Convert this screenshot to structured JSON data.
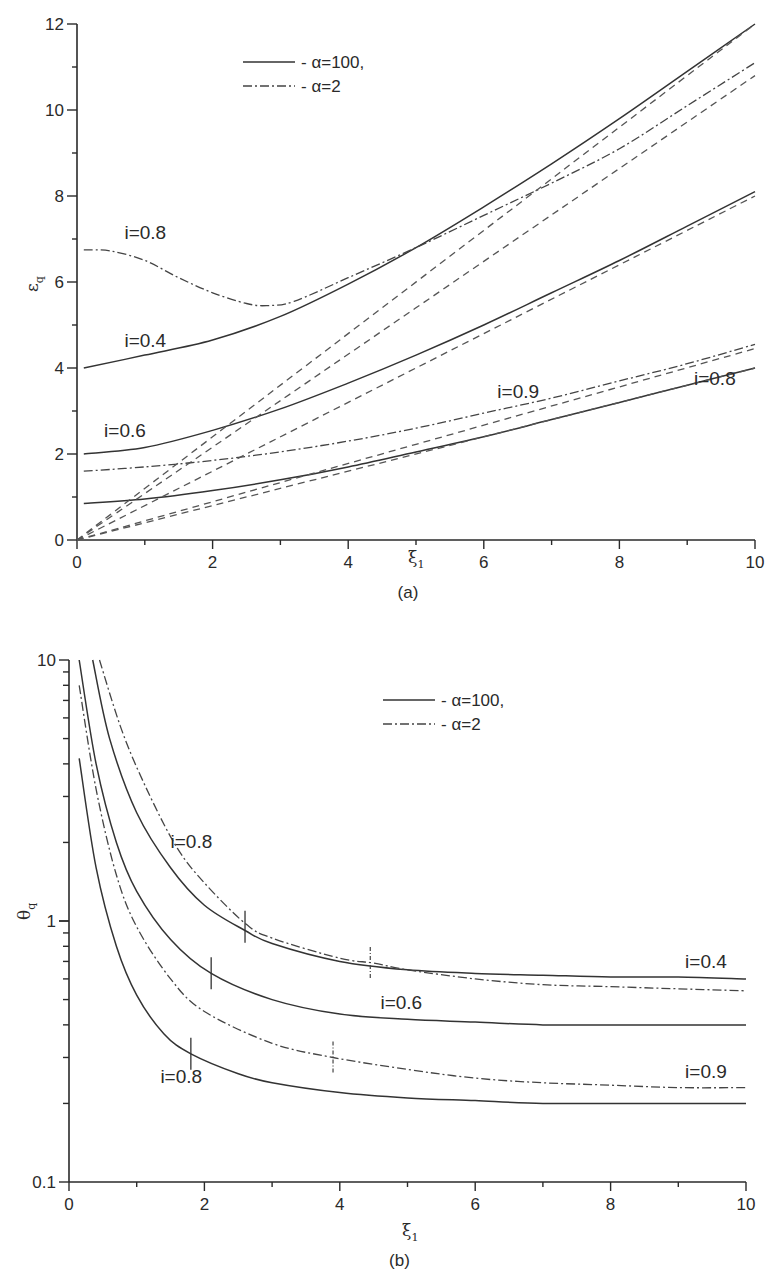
{
  "chart_data": [
    {
      "panel": "a",
      "type": "line",
      "caption": "(a)",
      "xlabel": "ξ",
      "xlabel_sub": "1",
      "ylabel": "ε",
      "ylabel_sub": "q",
      "xlim": [
        0,
        10
      ],
      "ylim": [
        0,
        12
      ],
      "xticks": [
        "0",
        "2",
        "4",
        "6",
        "8",
        "10"
      ],
      "yticks": [
        "0",
        "2",
        "4",
        "6",
        "8",
        "10",
        "12"
      ],
      "grid": false,
      "legend": {
        "position": "upper-center",
        "entries": [
          {
            "style": "solid",
            "label": "- α=100,"
          },
          {
            "style": "dashdot",
            "label": "- α=2"
          }
        ]
      },
      "annotations": [
        {
          "text": "i=0.8",
          "x": 0.7,
          "y": 7.0
        },
        {
          "text": "i=0.4",
          "x": 0.7,
          "y": 4.5
        },
        {
          "text": "i=0.6",
          "x": 0.4,
          "y": 2.4
        },
        {
          "text": "i=0.9",
          "x": 6.2,
          "y": 3.3
        },
        {
          "text": "i=0.8",
          "x": 9.1,
          "y": 3.6
        }
      ],
      "series": [
        {
          "name": "i=0.4, α=100",
          "style": "solid",
          "x": [
            0.1,
            1,
            2,
            3,
            4,
            5,
            6,
            7,
            8,
            9,
            10
          ],
          "y": [
            4.0,
            4.3,
            4.65,
            5.2,
            5.95,
            6.8,
            7.75,
            8.75,
            9.8,
            10.9,
            12.0
          ]
        },
        {
          "name": "i=0.6, α=100",
          "style": "solid",
          "x": [
            0.1,
            1,
            2,
            3,
            4,
            5,
            6,
            7,
            8,
            9,
            10
          ],
          "y": [
            2.0,
            2.15,
            2.55,
            3.05,
            3.65,
            4.3,
            5.0,
            5.75,
            6.5,
            7.3,
            8.1
          ]
        },
        {
          "name": "i=0.8, α=100",
          "style": "solid",
          "x": [
            0.1,
            1,
            2,
            3,
            4,
            5,
            6,
            7,
            8,
            9,
            10
          ],
          "y": [
            0.85,
            0.95,
            1.15,
            1.4,
            1.7,
            2.05,
            2.4,
            2.8,
            3.2,
            3.6,
            4.0
          ]
        },
        {
          "name": "i=0.8, α=2",
          "style": "dashdot",
          "x": [
            0.1,
            0.5,
            1,
            1.5,
            2,
            2.5,
            2.8,
            3.2,
            4,
            5,
            6,
            7,
            8,
            9,
            10
          ],
          "y": [
            6.75,
            6.72,
            6.5,
            6.1,
            5.75,
            5.5,
            5.45,
            5.55,
            6.1,
            6.8,
            7.55,
            8.3,
            9.1,
            10.1,
            11.1
          ]
        },
        {
          "name": "i=0.9, α=2",
          "style": "dashdot",
          "x": [
            0.1,
            1,
            2,
            3,
            4,
            5,
            6,
            7,
            8,
            9,
            10
          ],
          "y": [
            1.6,
            1.7,
            1.85,
            2.05,
            2.3,
            2.6,
            2.95,
            3.3,
            3.7,
            4.1,
            4.55
          ]
        },
        {
          "name": "asymptote 1",
          "style": "dashed",
          "x": [
            0,
            10
          ],
          "y": [
            0,
            12.0
          ]
        },
        {
          "name": "asymptote 2",
          "style": "dashed",
          "x": [
            0,
            10
          ],
          "y": [
            0,
            10.8
          ]
        },
        {
          "name": "asymptote 3",
          "style": "dashed",
          "x": [
            0,
            10
          ],
          "y": [
            0,
            8.0
          ]
        },
        {
          "name": "asymptote 4",
          "style": "dashed",
          "x": [
            0,
            10
          ],
          "y": [
            0,
            4.45
          ]
        },
        {
          "name": "asymptote 5",
          "style": "dashed",
          "x": [
            0,
            10
          ],
          "y": [
            0,
            4.0
          ]
        }
      ]
    },
    {
      "panel": "b",
      "type": "line",
      "caption": "(b)",
      "xlabel": "ξ",
      "xlabel_sub": "1",
      "ylabel": "θ",
      "ylabel_sub": "q",
      "xlim": [
        0,
        10
      ],
      "ylim": [
        0.1,
        10
      ],
      "yscale": "log",
      "xticks": [
        "0",
        "2",
        "4",
        "6",
        "8",
        "10"
      ],
      "yticks": [
        "0.1",
        "1",
        "10"
      ],
      "grid": false,
      "legend": {
        "position": "upper-right",
        "entries": [
          {
            "style": "solid",
            "label": "- α=100,"
          },
          {
            "style": "dashdot",
            "label": "- α=2"
          }
        ]
      },
      "annotations": [
        {
          "text": "i=0.8",
          "x": 1.5,
          "y": 1.9
        },
        {
          "text": "i=0.4",
          "x": 9.1,
          "y": 0.66
        },
        {
          "text": "i=0.6",
          "x": 4.6,
          "y": 0.46
        },
        {
          "text": "i=0.9",
          "x": 9.1,
          "y": 0.25
        },
        {
          "text": "i=0.8",
          "x": 1.35,
          "y": 0.24
        }
      ],
      "series": [
        {
          "name": "i=0.4, α=100",
          "style": "solid",
          "x": [
            0.35,
            0.6,
            1,
            1.5,
            2,
            2.6,
            3,
            4,
            5,
            6,
            7,
            8,
            9,
            10
          ],
          "y": [
            10,
            5.0,
            2.6,
            1.6,
            1.15,
            0.92,
            0.82,
            0.7,
            0.65,
            0.63,
            0.62,
            0.61,
            0.61,
            0.6
          ]
        },
        {
          "name": "i=0.8, α=2",
          "style": "dashdot",
          "x": [
            0.45,
            0.8,
            1.2,
            1.6,
            2,
            2.6,
            3,
            4,
            4.5,
            5,
            6,
            7,
            8,
            9,
            10
          ],
          "y": [
            10,
            5.2,
            3.0,
            1.9,
            1.4,
            0.98,
            0.86,
            0.72,
            0.69,
            0.65,
            0.6,
            0.57,
            0.56,
            0.55,
            0.54
          ]
        },
        {
          "name": "i=0.6, α=100",
          "style": "solid",
          "x": [
            0.15,
            0.4,
            0.7,
            1,
            1.5,
            2.1,
            3,
            4,
            5,
            6,
            7,
            8,
            9,
            10
          ],
          "y": [
            10,
            4.0,
            2.0,
            1.3,
            0.85,
            0.63,
            0.5,
            0.44,
            0.42,
            0.41,
            0.4,
            0.4,
            0.4,
            0.4
          ]
        },
        {
          "name": "i=0.9, α=2",
          "style": "dashdot",
          "x": [
            0.15,
            0.4,
            0.7,
            1,
            1.5,
            2,
            3,
            3.9,
            5,
            6,
            7,
            8,
            9,
            10
          ],
          "y": [
            8.0,
            3.2,
            1.5,
            0.95,
            0.6,
            0.45,
            0.34,
            0.3,
            0.27,
            0.25,
            0.24,
            0.235,
            0.23,
            0.23
          ]
        },
        {
          "name": "i=0.8, α=100",
          "style": "solid",
          "x": [
            0.15,
            0.4,
            0.7,
            1,
            1.4,
            1.8,
            2.5,
            3,
            4,
            5,
            6,
            7,
            8,
            9,
            10
          ],
          "y": [
            4.2,
            1.6,
            0.8,
            0.52,
            0.37,
            0.31,
            0.26,
            0.24,
            0.22,
            0.21,
            0.205,
            0.2,
            0.2,
            0.2,
            0.2
          ]
        }
      ],
      "markers": [
        {
          "series": "i=0.4, α=100",
          "x": 2.6,
          "y": 0.95,
          "style": "solid"
        },
        {
          "series": "i=0.8, α=2",
          "x": 4.45,
          "y": 0.69,
          "style": "dashdot"
        },
        {
          "series": "i=0.6, α=100",
          "x": 2.1,
          "y": 0.63,
          "style": "solid"
        },
        {
          "series": "i=0.9, α=2",
          "x": 3.9,
          "y": 0.3,
          "style": "dashdot"
        },
        {
          "series": "i=0.8, α=100",
          "x": 1.8,
          "y": 0.31,
          "style": "solid"
        }
      ]
    }
  ]
}
